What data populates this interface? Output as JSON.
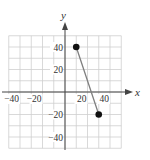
{
  "chart_data": {
    "type": "line",
    "title": "",
    "xlabel": "x",
    "ylabel": "y",
    "xlim": [
      -50,
      50
    ],
    "ylim": [
      -50,
      50
    ],
    "grid": true,
    "grid_step": 10,
    "x_ticks": [
      -40,
      -20,
      20,
      40
    ],
    "y_ticks": [
      40,
      20,
      -20,
      -40
    ],
    "x_tick_labels": [
      "−40",
      "−20",
      "20",
      "40"
    ],
    "y_tick_labels": [
      "40",
      "20",
      "−20",
      "−40"
    ],
    "series": [
      {
        "name": "segment",
        "points": [
          {
            "x": 10,
            "y": 40
          },
          {
            "x": 30,
            "y": -20
          }
        ],
        "endpoints_marked": true
      }
    ]
  },
  "colors": {
    "grid": "#cfcfcf",
    "axis": "#444444",
    "segment": "#808080",
    "point": "#111111"
  }
}
